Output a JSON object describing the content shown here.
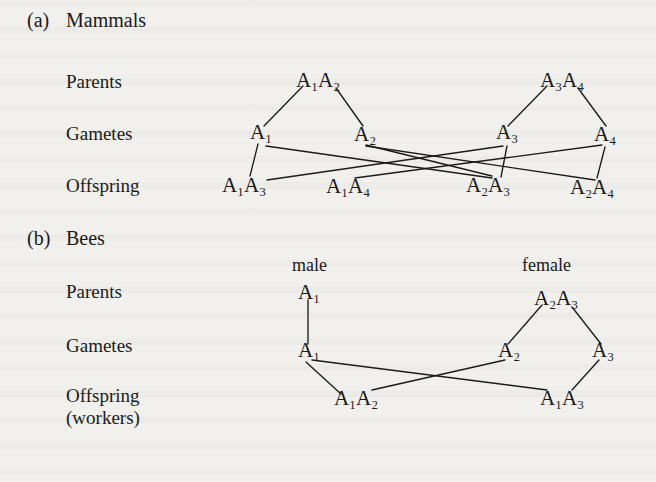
{
  "figure": {
    "background_color": "#f1f0ec",
    "ink_color": "#1a1a18"
  },
  "sections": [
    {
      "id": "mammals",
      "tag": "(a)",
      "title": "Mammals",
      "row_labels": [
        "Parents",
        "Gametes",
        "Offspring"
      ],
      "sex_labels": [],
      "parents": [
        {
          "id": "p-left",
          "label": "A1A2",
          "display": "A₁A₂"
        },
        {
          "id": "p-right",
          "label": "A3A4",
          "display": "A₃A₄"
        }
      ],
      "gametes": [
        {
          "id": "g-a1",
          "label": "A1",
          "display": "A₁"
        },
        {
          "id": "g-a2",
          "label": "A2",
          "display": "A₂"
        },
        {
          "id": "g-a3",
          "label": "A3",
          "display": "A₃"
        },
        {
          "id": "g-a4",
          "label": "A4",
          "display": "A₄"
        }
      ],
      "offspring": [
        {
          "id": "o-a1a3",
          "label": "A1A3",
          "display": "A₁A₃"
        },
        {
          "id": "o-a1a4",
          "label": "A1A4",
          "display": "A₁A₄"
        },
        {
          "id": "o-a2a3",
          "label": "A2A3",
          "display": "A₂A₃"
        },
        {
          "id": "o-a2a4",
          "label": "A2A4",
          "display": "A₂A₄"
        }
      ]
    },
    {
      "id": "bees",
      "tag": "(b)",
      "title": "Bees",
      "row_labels": [
        "Parents",
        "Gametes",
        "Offspring"
      ],
      "row_label_sub": "(workers)",
      "sex_labels": [
        "male",
        "female"
      ],
      "parents": [
        {
          "id": "bp-male",
          "label": "A1",
          "display": "A₁"
        },
        {
          "id": "bp-female",
          "label": "A2A3",
          "display": "A₂A₃"
        }
      ],
      "gametes": [
        {
          "id": "bg-a1",
          "label": "A1",
          "display": "A₁"
        },
        {
          "id": "bg-a2",
          "label": "A2",
          "display": "A₂"
        },
        {
          "id": "bg-a3",
          "label": "A3",
          "display": "A₃"
        }
      ],
      "offspring": [
        {
          "id": "bo-a1a2",
          "label": "A1A2",
          "display": "A₁A₂"
        },
        {
          "id": "bo-a1a3",
          "label": "A1A3",
          "display": "A₁A₃"
        }
      ]
    }
  ]
}
